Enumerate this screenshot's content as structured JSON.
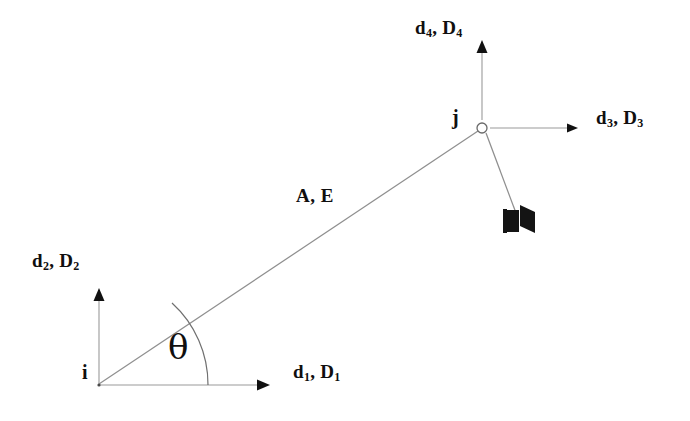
{
  "figure": {
    "type": "structural-element-diagram",
    "background_color": "#ffffff",
    "ink_color": "#100f0f",
    "line_color": "#8a8a8a"
  },
  "nodes": [
    {
      "id": "i",
      "label": "i",
      "x": 98,
      "y": 385
    },
    {
      "id": "j",
      "label": "j",
      "x": 482,
      "y": 128
    }
  ],
  "member": {
    "property_label": "A, E",
    "from": "i",
    "to": "j",
    "angle_label": "θ"
  },
  "dof": [
    {
      "id": "d1",
      "label": "d",
      "sub": "1",
      "label2": "D",
      "sub2": "1",
      "text": "d1, D1",
      "node": "i",
      "direction": "right"
    },
    {
      "id": "d2",
      "label": "d",
      "sub": "2",
      "label2": "D",
      "sub2": "2",
      "text": "d2, D2",
      "node": "i",
      "direction": "up"
    },
    {
      "id": "d3",
      "label": "d",
      "sub": "3",
      "label2": "D",
      "sub2": "3",
      "text": "d3, D3",
      "node": "j",
      "direction": "right"
    },
    {
      "id": "d4",
      "label": "d",
      "sub": "4",
      "label2": "D",
      "sub2": "4",
      "text": "d4, D4",
      "node": "j",
      "direction": "up"
    }
  ],
  "labels": {
    "d1_a": "d",
    "d1_b": "1",
    "d1_c": ", D",
    "d1_d": "1",
    "d2_a": "d",
    "d2_b": "2",
    "d2_c": ", D",
    "d2_d": "2",
    "d3_a": "d",
    "d3_b": "3",
    "d3_c": ", D",
    "d3_d": "3",
    "d4_a": "d",
    "d4_b": "4",
    "d4_c": ", D",
    "d4_d": "4",
    "node_i": "i",
    "node_j": "j",
    "member_props": "A, E",
    "angle": "θ"
  }
}
